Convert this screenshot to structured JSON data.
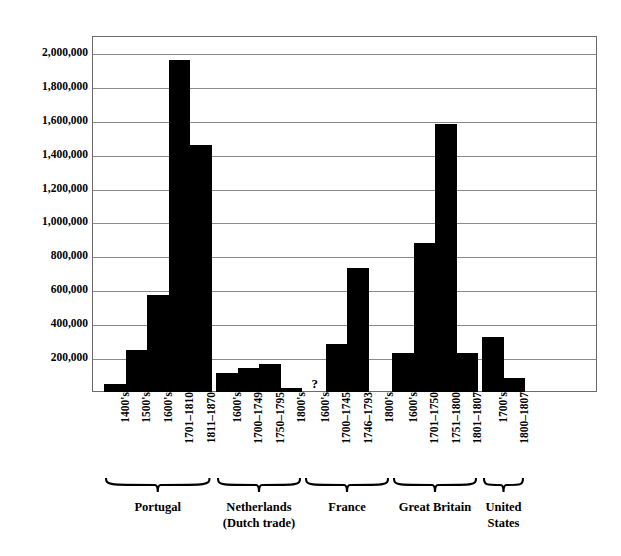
{
  "figure": {
    "clipped_title_fragment": "",
    "background_color": "#ffffff",
    "bar_color": "#000000",
    "frame_color": "#6b6b6b",
    "gridline_color": "#8a8a8a"
  },
  "yaxis": {
    "ticks": [
      "200,000",
      "400,000",
      "600,000",
      "800,000",
      "1,000,000",
      "1,200,000",
      "1,400,000",
      "1,600,000",
      "1,800,000",
      "2,000,000"
    ]
  },
  "groups": [
    {
      "name": "Portugal"
    },
    {
      "name": "Netherlands\n(Dutch trade)"
    },
    {
      "name": "France"
    },
    {
      "name": "Great Britain"
    },
    {
      "name": "United\nStates"
    }
  ],
  "chart_data": {
    "type": "bar",
    "title": "",
    "xlabel": "",
    "ylabel": "",
    "ylim": [
      0,
      2100000
    ],
    "ytick_step": 200000,
    "grid": true,
    "legend": "none",
    "unknown_marker": "?",
    "groups": [
      {
        "group": "Portugal",
        "categories": [
          "1400's",
          "1500's",
          "1600's",
          "1701–1810",
          "1811–1870"
        ],
        "values": [
          50000,
          250000,
          570000,
          1960000,
          1460000
        ]
      },
      {
        "group": "Netherlands (Dutch trade)",
        "categories": [
          "1600's",
          "1700–1749",
          "1750–1795",
          "1800's"
        ],
        "values": [
          110000,
          140000,
          165000,
          25000
        ]
      },
      {
        "group": "France",
        "categories": [
          "1600's",
          "1700–1745",
          "1746–1793",
          "1800's"
        ],
        "values": [
          null,
          285000,
          730000,
          0
        ]
      },
      {
        "group": "Great Britain",
        "categories": [
          "1600's",
          "1701–1750",
          "1751–1800",
          "1801–1807"
        ],
        "values": [
          230000,
          880000,
          1580000,
          230000
        ]
      },
      {
        "group": "United States",
        "categories": [
          "1700's",
          "1800–1807"
        ],
        "values": [
          325000,
          85000
        ]
      }
    ]
  }
}
